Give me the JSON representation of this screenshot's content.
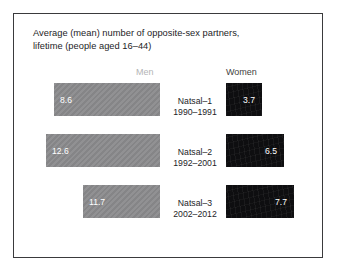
{
  "chart_data": {
    "type": "bar",
    "title": "Average (mean) number of opposite-sex partners, lifetime (people aged 16–44)",
    "title_lines": [
      "Average (mean) number of opposite-sex partners,",
      "lifetime (people aged 16–44)"
    ],
    "orientation": "horizontal-diverging",
    "categories": [
      "Natsal–1",
      "Natsal–2",
      "Natsal–3"
    ],
    "category_sublabels": [
      "1990–1991",
      "1992–2001",
      "2002–2012"
    ],
    "series": [
      {
        "name": "Men",
        "values": [
          8.6,
          12.6,
          11.7
        ],
        "color": "#8b8b8d"
      },
      {
        "name": "Women",
        "values": [
          3.7,
          6.5,
          7.7
        ],
        "color": "#0e0e10"
      }
    ],
    "xlabel": "",
    "ylabel": "",
    "legend_position": "top",
    "grid": false,
    "value_labels": true,
    "max_value": 12.6
  },
  "figure": {
    "title": {
      "line1": "Average (mean) number of opposite-sex partners,",
      "line2": "lifetime (people aged 16–44)"
    },
    "headers": {
      "men": "Men",
      "women": "Women"
    },
    "rows": [
      {
        "survey": "Natsal–1",
        "period": "1990–1991",
        "men_value": "8.6",
        "women_value": "3.7",
        "men_width": 106,
        "women_width": 36
      },
      {
        "survey": "Natsal–2",
        "period": "1992–2001",
        "men_value": "12.6",
        "women_value": "6.5",
        "men_width": 114,
        "women_width": 58
      },
      {
        "survey": "Natsal–3",
        "period": "2002–2012",
        "men_value": "11.7",
        "women_value": "7.7",
        "men_width": 77,
        "women_width": 68
      }
    ]
  }
}
